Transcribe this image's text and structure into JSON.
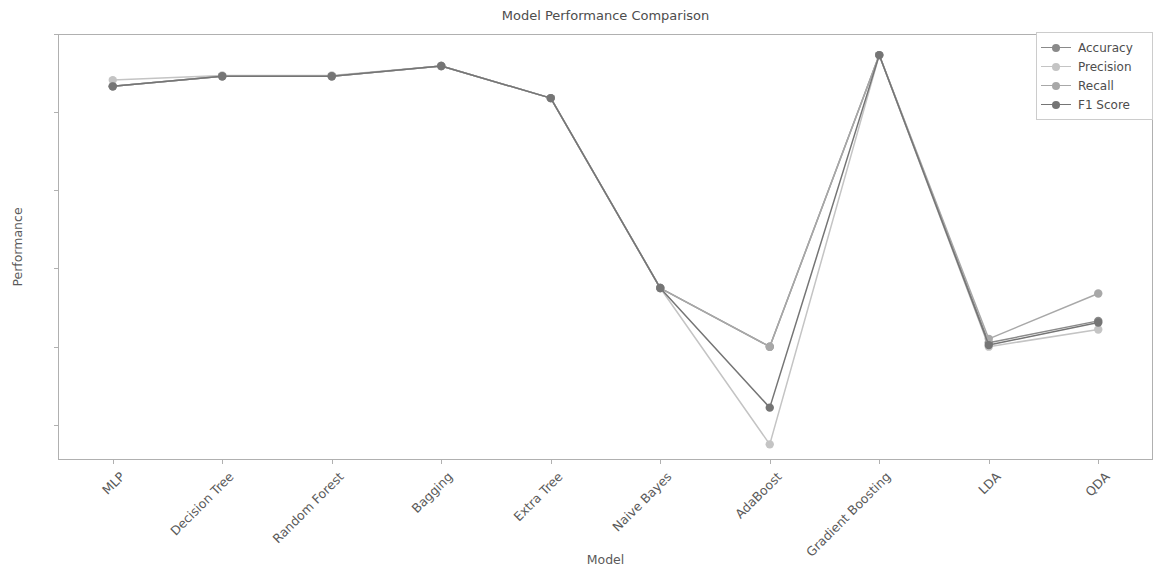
{
  "chart_data": {
    "type": "line",
    "title": "Model Performance Comparison",
    "xlabel": "Model",
    "ylabel": "Performance",
    "categories": [
      "MLP",
      "Decision Tree",
      "Random Forest",
      "Bagging",
      "Extra Tree",
      "Naive Bayes",
      "AdaBoost",
      "Gradient Boosting",
      "LDA",
      "QDA"
    ],
    "ylim": [
      0.455,
      1.0
    ],
    "yticks": [
      "0.5",
      "0.6",
      "0.7",
      "0.8",
      "0.9",
      "1.0"
    ],
    "ytick_values": [
      0.5,
      0.6,
      0.7,
      0.8,
      0.9,
      1.0
    ],
    "grid": false,
    "legend_position": "upper right",
    "series": [
      {
        "name": "Accuracy",
        "color": "#8a8a8a",
        "values": [
          0.933,
          0.946,
          0.946,
          0.959,
          0.918,
          0.675,
          0.6,
          0.973,
          0.605,
          0.633
        ]
      },
      {
        "name": "Precision",
        "color": "#c4c4c4",
        "values": [
          0.941,
          0.947,
          0.947,
          0.959,
          0.918,
          0.675,
          0.475,
          0.973,
          0.6,
          0.622
        ]
      },
      {
        "name": "Recall",
        "color": "#a8a8a8",
        "values": [
          0.933,
          0.946,
          0.946,
          0.959,
          0.918,
          0.675,
          0.6,
          0.973,
          0.61,
          0.668
        ]
      },
      {
        "name": "F1 Score",
        "color": "#757575",
        "values": [
          0.933,
          0.946,
          0.946,
          0.959,
          0.918,
          0.675,
          0.522,
          0.973,
          0.602,
          0.631
        ]
      }
    ]
  },
  "axis": {
    "title": "Model Performance Comparison",
    "ylabel": "Performance",
    "xlabel": "Model"
  },
  "legend": {
    "items": [
      {
        "label": "Accuracy"
      },
      {
        "label": "Precision"
      },
      {
        "label": "Recall"
      },
      {
        "label": "F1 Score"
      }
    ]
  }
}
